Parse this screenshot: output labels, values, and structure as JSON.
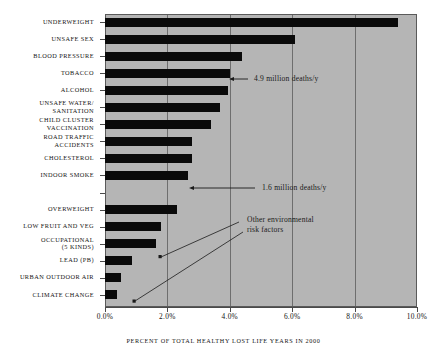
{
  "chart_data": {
    "type": "bar",
    "orientation": "horizontal",
    "title": "",
    "xlabel": "PERCENT OF TOTAL HEALTHY LOST LIFE YEARS IN 2000",
    "ylabel": "",
    "xlim": [
      0,
      10
    ],
    "xticks": [
      "0.0%",
      "2.0%",
      "4.0%",
      "6.0%",
      "8.0%",
      "10.0%"
    ],
    "xtick_values": [
      0,
      2,
      4,
      6,
      8,
      10
    ],
    "grid": true,
    "legend": "none",
    "categories": [
      "UNDERWEIGHT",
      "UNSAFE SEX",
      "BLOOD PRESSURE",
      "TOBACCO",
      "ALCOHOL",
      "UNSAFE WATER/\nSANITATION",
      "CHILD CLUSTER\nVACCINATION",
      "ROAD TRAFFIC\nACCIDENTS",
      "CHOLESTEROL",
      "INDOOR SMOKE",
      "",
      "OVERWEIGHT",
      "LOW FRUIT AND VEG",
      "OCCUPATIONAL\n(5 KINDS)",
      "LEAD (PB)",
      "URBAN OUTDOOR AIR",
      "CLIMATE CHANGE"
    ],
    "values": [
      9.4,
      6.1,
      4.4,
      4.0,
      3.95,
      3.7,
      3.4,
      2.8,
      2.8,
      2.65,
      null,
      2.3,
      1.8,
      1.65,
      0.85,
      0.5,
      0.38
    ],
    "annotations": [
      {
        "text": "4.9 million deaths/y",
        "target_category": "TOBACCO"
      },
      {
        "text": "1.6 million deaths/y",
        "target_category": "INDOOR SMOKE"
      },
      {
        "text": "Other environmental\nrisk factors",
        "target_categories": [
          "OCCUPATIONAL (5 KINDS)",
          "CLIMATE CHANGE"
        ]
      }
    ],
    "colors": {
      "bar": "#0a0a0a",
      "plot_background": "#b5b5b5",
      "page_background": "#ffffff",
      "gridline": "#6e6e6e",
      "axis": "#4a4a4a",
      "text": "#141414"
    }
  }
}
